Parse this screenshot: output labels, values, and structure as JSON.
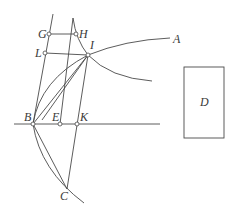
{
  "diagram": {
    "type": "geometric-construction",
    "stroke_color": "#4a4a4a",
    "background": "#ffffff",
    "labels": {
      "G": "G",
      "H": "H",
      "L": "L",
      "I": "I",
      "A": "A",
      "B": "B",
      "E": "E",
      "K": "K",
      "C": "C",
      "D": "D"
    },
    "points": {
      "G": [
        49,
        34
      ],
      "H": [
        76,
        34
      ],
      "L": [
        45,
        53
      ],
      "I": [
        88,
        55
      ],
      "B": [
        33,
        124
      ],
      "E": [
        60,
        124
      ],
      "K": [
        77,
        124
      ],
      "C": [
        67,
        189
      ]
    },
    "rectangle_D": {
      "x": 184,
      "y": 67,
      "width": 40,
      "height": 71
    }
  }
}
